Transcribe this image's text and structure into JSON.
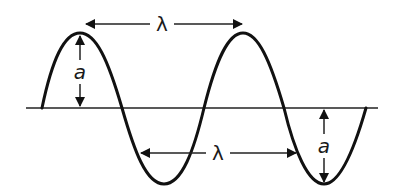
{
  "diagram": {
    "title": "",
    "colors": {
      "stroke": "#111111",
      "background": "#ffffff"
    },
    "labels": {
      "wavelength_top": "λ",
      "wavelength_bottom": "λ",
      "amplitude_left": "a",
      "amplitude_right": "a"
    },
    "geometry": {
      "baseline_y": 108,
      "baseline_x": [
        26,
        378
      ],
      "peaks": [
        [
          80,
          33
        ],
        [
          243,
          33
        ]
      ],
      "troughs": [
        [
          164,
          184
        ],
        [
          324,
          184
        ]
      ],
      "wave_start_x": 42,
      "wave_end_x": 366
    }
  }
}
